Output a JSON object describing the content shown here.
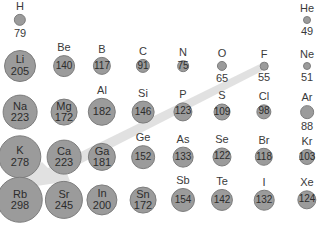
{
  "colors": {
    "circle_fill": "#9b9b9b",
    "circle_border": "#7d7d7d",
    "arrow": "#d9d9d9",
    "text": "#3a3a3a",
    "background": "#ffffff"
  },
  "arrow": {
    "description": "trend arrow from F (upper right) toward Rb (lower left) indicating increasing atomic radius",
    "from": "F",
    "to": "Rb"
  },
  "elements": [
    {
      "symbol": "H",
      "radius": 79,
      "col": 0,
      "row": 0,
      "label_inside": false
    },
    {
      "symbol": "He",
      "radius": 49,
      "col": 7,
      "row": 0,
      "label_inside": false
    },
    {
      "symbol": "Li",
      "radius": 205,
      "col": 0,
      "row": 1,
      "label_inside": "both"
    },
    {
      "symbol": "Be",
      "radius": 140,
      "col": 1,
      "row": 1,
      "label_inside": "value"
    },
    {
      "symbol": "B",
      "radius": 117,
      "col": 2,
      "row": 1,
      "label_inside": "value"
    },
    {
      "symbol": "C",
      "radius": 91,
      "col": 3,
      "row": 1,
      "label_inside": "value"
    },
    {
      "symbol": "N",
      "radius": 75,
      "col": 4,
      "row": 1,
      "label_inside": "value"
    },
    {
      "symbol": "O",
      "radius": 65,
      "col": 5,
      "row": 1,
      "label_inside": false
    },
    {
      "symbol": "F",
      "radius": 55,
      "col": 6,
      "row": 1,
      "label_inside": false
    },
    {
      "symbol": "Ne",
      "radius": 51,
      "col": 7,
      "row": 1,
      "label_inside": false
    },
    {
      "symbol": "Na",
      "radius": 223,
      "col": 0,
      "row": 2,
      "label_inside": "both"
    },
    {
      "symbol": "Mg",
      "radius": 172,
      "col": 1,
      "row": 2,
      "label_inside": "both"
    },
    {
      "symbol": "Al",
      "radius": 182,
      "col": 2,
      "row": 2,
      "label_inside": "value"
    },
    {
      "symbol": "Si",
      "radius": 146,
      "col": 3,
      "row": 2,
      "label_inside": "value"
    },
    {
      "symbol": "P",
      "radius": 123,
      "col": 4,
      "row": 2,
      "label_inside": "value"
    },
    {
      "symbol": "S",
      "radius": 109,
      "col": 5,
      "row": 2,
      "label_inside": "value"
    },
    {
      "symbol": "Cl",
      "radius": 98,
      "col": 6,
      "row": 2,
      "label_inside": "value"
    },
    {
      "symbol": "Ar",
      "radius": 88,
      "col": 7,
      "row": 2,
      "label_inside": false
    },
    {
      "symbol": "K",
      "radius": 278,
      "col": 0,
      "row": 3,
      "label_inside": "both"
    },
    {
      "symbol": "Ca",
      "radius": 223,
      "col": 1,
      "row": 3,
      "label_inside": "both"
    },
    {
      "symbol": "Ga",
      "radius": 181,
      "col": 2,
      "row": 3,
      "label_inside": "both"
    },
    {
      "symbol": "Ge",
      "radius": 152,
      "col": 3,
      "row": 3,
      "label_inside": "value"
    },
    {
      "symbol": "As",
      "radius": 133,
      "col": 4,
      "row": 3,
      "label_inside": "value"
    },
    {
      "symbol": "Se",
      "radius": 122,
      "col": 5,
      "row": 3,
      "label_inside": "value"
    },
    {
      "symbol": "Br",
      "radius": 118,
      "col": 6,
      "row": 3,
      "label_inside": "value"
    },
    {
      "symbol": "Kr",
      "radius": 103,
      "col": 7,
      "row": 3,
      "label_inside": "value"
    },
    {
      "symbol": "Rb",
      "radius": 298,
      "col": 0,
      "row": 4,
      "label_inside": "both"
    },
    {
      "symbol": "Sr",
      "radius": 245,
      "col": 1,
      "row": 4,
      "label_inside": "both"
    },
    {
      "symbol": "In",
      "radius": 200,
      "col": 2,
      "row": 4,
      "label_inside": "both"
    },
    {
      "symbol": "Sn",
      "radius": 172,
      "col": 3,
      "row": 4,
      "label_inside": "both"
    },
    {
      "symbol": "Sb",
      "radius": 154,
      "col": 4,
      "row": 4,
      "label_inside": "value"
    },
    {
      "symbol": "Te",
      "radius": 142,
      "col": 5,
      "row": 4,
      "label_inside": "value"
    },
    {
      "symbol": "I",
      "radius": 132,
      "col": 6,
      "row": 4,
      "label_inside": "value"
    },
    {
      "symbol": "Xe",
      "radius": 124,
      "col": 7,
      "row": 4,
      "label_inside": "value"
    }
  ]
}
